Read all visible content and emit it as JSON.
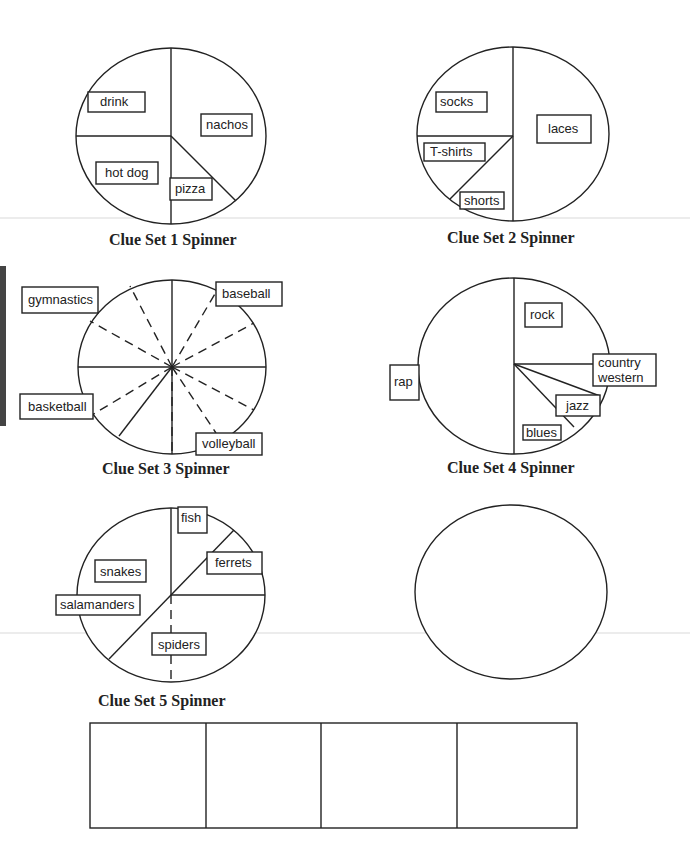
{
  "spinners": [
    {
      "caption": "Clue Set 1 Spinner",
      "labels": [
        "drink",
        "nachos",
        "hot dog",
        "pizza"
      ]
    },
    {
      "caption": "Clue Set 2 Spinner",
      "labels": [
        "socks",
        "laces",
        "T-shirts",
        "shorts"
      ]
    },
    {
      "caption": "Clue Set 3 Spinner",
      "labels": [
        "gymnastics",
        "baseball",
        "basketball",
        "volleyball"
      ]
    },
    {
      "caption": "Clue Set 4 Spinner",
      "labels": [
        "rock",
        "rap",
        "country",
        "western",
        "jazz",
        "blues"
      ]
    },
    {
      "caption": "Clue Set 5 Spinner",
      "labels": [
        "fish",
        "snakes",
        "ferrets",
        "salamanders",
        "spiders"
      ]
    },
    {
      "caption": "",
      "labels": []
    }
  ],
  "answer_boxes": {
    "count": 4
  },
  "colors": {
    "ink": "#222222",
    "paper": "#ffffff"
  }
}
